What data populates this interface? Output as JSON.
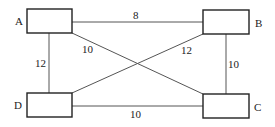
{
  "diagram": {
    "type": "weighted-graph",
    "nodes": [
      {
        "id": "A",
        "label": "A",
        "x": 27,
        "y": 9,
        "w": 45,
        "h": 24,
        "label_x": 15,
        "label_y": 25
      },
      {
        "id": "B",
        "label": "B",
        "x": 203,
        "y": 10,
        "w": 46,
        "h": 24,
        "label_x": 255,
        "label_y": 27
      },
      {
        "id": "C",
        "label": "C",
        "x": 203,
        "y": 94,
        "w": 46,
        "h": 24,
        "label_x": 254,
        "label_y": 111
      },
      {
        "id": "D",
        "label": "D",
        "x": 27,
        "y": 93,
        "w": 45,
        "h": 24,
        "label_x": 14,
        "label_y": 109
      }
    ],
    "edges": [
      {
        "from": "A",
        "to": "B",
        "weight": "8",
        "label_x": 136,
        "label_y": 19
      },
      {
        "from": "A",
        "to": "D",
        "weight": "12",
        "label_x": 35,
        "label_y": 67
      },
      {
        "from": "A",
        "to": "C",
        "weight": "10",
        "label_x": 83,
        "label_y": 52
      },
      {
        "from": "B",
        "to": "D",
        "weight": "12",
        "label_x": 181,
        "label_y": 53
      },
      {
        "from": "B",
        "to": "C",
        "weight": "10",
        "label_x": 228,
        "label_y": 68
      },
      {
        "from": "D",
        "to": "C",
        "weight": "10",
        "label_x": 132,
        "label_y": 118
      }
    ]
  }
}
